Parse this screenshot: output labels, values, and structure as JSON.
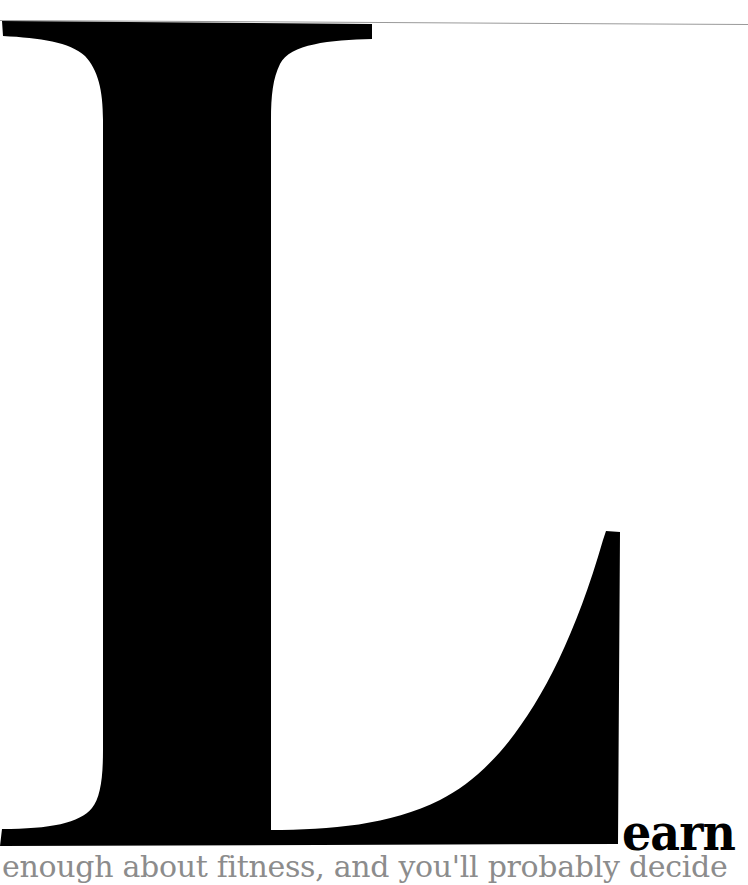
{
  "page": {
    "drop_cap_letter": "L",
    "lead_word": "earn",
    "body_text_line": "enough about fitness, and you'll probably decide",
    "colors": {
      "drop_cap": "#000000",
      "lead_word": "#000000",
      "body_text": "#8c8c8c",
      "rule": "#9a9a9a",
      "background": "#ffffff"
    }
  }
}
